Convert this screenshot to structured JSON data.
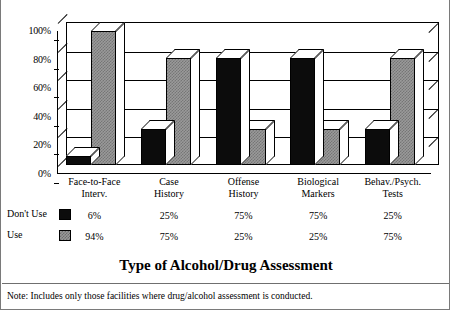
{
  "chart_data": {
    "type": "bar",
    "title": "Type of Alcohol/Drug Assessment",
    "xlabel": "",
    "ylabel": "",
    "ylim": [
      0,
      100
    ],
    "yticks": [
      "0%",
      "20%",
      "40%",
      "60%",
      "80%",
      "100%"
    ],
    "ytick_values": [
      0,
      20,
      40,
      60,
      80,
      100
    ],
    "grid": true,
    "legend_position": "below-axis-table",
    "categories": [
      "Face-to-Face Interv.",
      "Case History",
      "Offense History",
      "Biological Markers",
      "Behav./Psych. Tests"
    ],
    "category_lines": [
      [
        "Face-to-Face",
        "Interv."
      ],
      [
        "Case",
        "History"
      ],
      [
        "Offense",
        "History"
      ],
      [
        "Biological",
        "Markers"
      ],
      [
        "Behav./Psych.",
        "Tests"
      ]
    ],
    "series": [
      {
        "name": "Don't Use",
        "color": "#0c0c0c",
        "values": [
          6,
          25,
          75,
          75,
          25
        ],
        "labels": [
          "6%",
          "25%",
          "75%",
          "75%",
          "25%"
        ]
      },
      {
        "name": "Use",
        "color": "#9a9a9a",
        "values": [
          94,
          75,
          25,
          25,
          75
        ],
        "labels": [
          "94%",
          "75%",
          "25%",
          "25%",
          "75%"
        ]
      }
    ],
    "footnote": "Note: Includes only those facilities where drug/alcohol assessment is conducted."
  }
}
